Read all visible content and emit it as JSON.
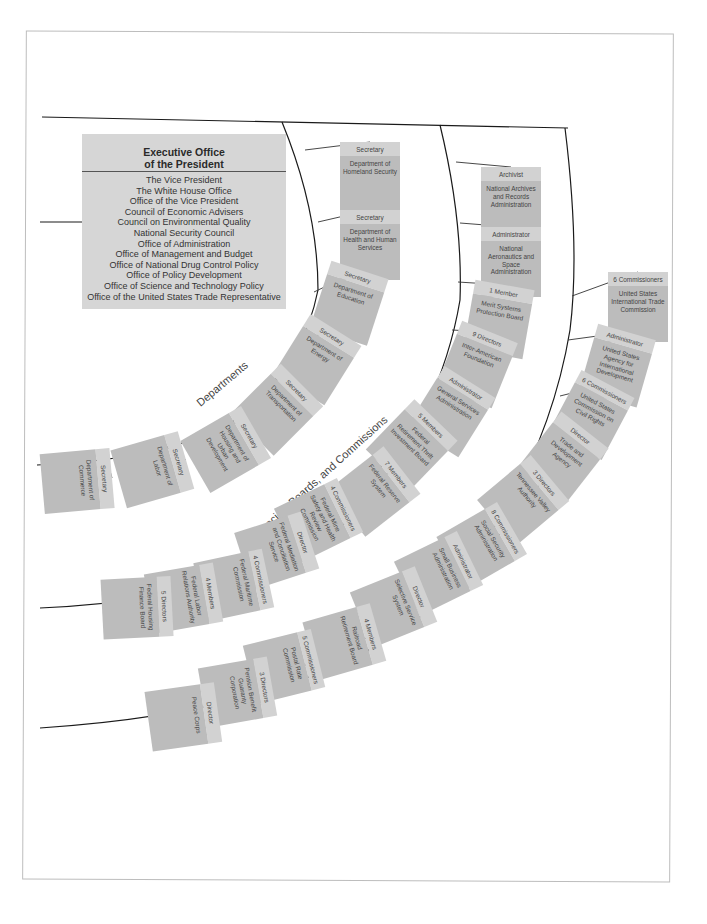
{
  "executive_office": {
    "title_line1": "Executive Office",
    "title_line2": "of the President",
    "items": [
      "The Vice President",
      "The White House Office",
      "Office of the Vice President",
      "Council of Economic Advisers",
      "Council on Environmental Quality",
      "National Security Council",
      "Office of Administration",
      "Office of Management and Budget",
      "Office of National Drug Control Policy",
      "Office of Policy Development",
      "Office of Science and Technology Policy",
      "Office of the United States Trade Representative"
    ]
  },
  "arc_labels": {
    "departments": "Departments",
    "agencies": "Agencies, Boards, and Commissions"
  },
  "departments": [
    {
      "head": "Secretary",
      "name": "Department of Homeland Security"
    },
    {
      "head": "Secretary",
      "name": "Department of Health and Human Services"
    },
    {
      "head": "Secretary",
      "name": "Department of Education"
    },
    {
      "head": "Secretary",
      "name": "Department of Energy"
    },
    {
      "head": "Secretary",
      "name": "Department of Transportation"
    },
    {
      "head": "Secretary",
      "name": "Department of Housing and Urban Development"
    },
    {
      "head": "Secretary",
      "name": "Department of Labor"
    },
    {
      "head": "Secretary",
      "name": "Department of Commerce"
    }
  ],
  "agencies_inner": [
    {
      "head": "Archivist",
      "name": "National Archives and Records Administration"
    },
    {
      "head": "Administrator",
      "name": "National Aeronautics and Space Administration"
    },
    {
      "head": "1 Member",
      "name": "Merit Systems Protection Board"
    },
    {
      "head": "9 Directors",
      "name": "Inter-American Foundation"
    },
    {
      "head": "Administrator",
      "name": "General Services Administration"
    },
    {
      "head": "5 Members",
      "name": "Federal Retirement Thrift Investment Board"
    },
    {
      "head": "7 Members",
      "name": "Federal Reserve System"
    },
    {
      "head": "4 Commissioners",
      "name": "Federal Mine Safety and Health Review Commission"
    },
    {
      "head": "Director",
      "name": "Federal Mediation and Conciliation Service"
    },
    {
      "head": "4 Commissioners",
      "name": "Federal Maritime Commission"
    },
    {
      "head": "4 Members",
      "name": "Federal Labor Relations Authority"
    },
    {
      "head": "5 Directors",
      "name": "Federal Housing Finance Board"
    }
  ],
  "agencies_outer": [
    {
      "head": "6 Commissioners",
      "name": "United States International Trade Commission"
    },
    {
      "head": "Administrator",
      "name": "United States Agency for International Development"
    },
    {
      "head": "6 Commissioners",
      "name": "United States Commission on Civil Rights"
    },
    {
      "head": "Director",
      "name": "Trade and Development Agency"
    },
    {
      "head": "3 Directors",
      "name": "Tennessee Valley Authority"
    },
    {
      "head": "8 Commissioners",
      "name": "Social Security Administration"
    },
    {
      "head": "Administrator",
      "name": "Small Business Administration"
    },
    {
      "head": "Director",
      "name": "Selective Service System"
    },
    {
      "head": "4 Members",
      "name": "Railroad Retirement Board"
    },
    {
      "head": "5 Commissioners",
      "name": "Postal Rate Commission"
    },
    {
      "head": "3 Directors",
      "name": "Pension Benefit Guaranty Corporation"
    },
    {
      "head": "Director",
      "name": "Peace Corps"
    }
  ],
  "colors": {
    "box_head": "#d2d2d2",
    "box_body": "#bcbcbc",
    "eop_fill": "#d6d6d6",
    "line": "#1a1a1a",
    "frame": "#bdbdbd"
  }
}
